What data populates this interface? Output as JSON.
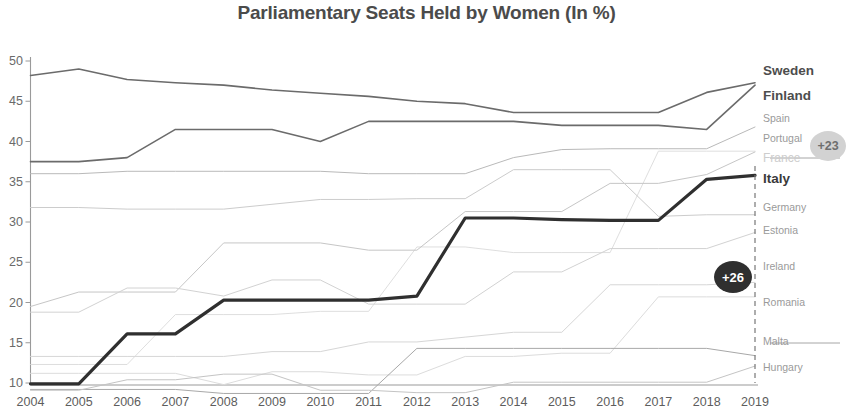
{
  "chart_data": {
    "type": "line",
    "title": "Parliamentary Seats Held by Women (In %)",
    "xlabel": "",
    "ylabel": "",
    "x": [
      2004,
      2005,
      2006,
      2007,
      2008,
      2009,
      2010,
      2011,
      2012,
      2013,
      2014,
      2015,
      2016,
      2017,
      2018,
      2019
    ],
    "xtick_labels": [
      "2004",
      "2005",
      "2006",
      "2007",
      "2008",
      "2009",
      "2010",
      "2011",
      "2012",
      "2013",
      "2014",
      "2015",
      "2016",
      "2017",
      "2018",
      "2019"
    ],
    "ytick_labels": [
      "10",
      "15",
      "20",
      "25",
      "30",
      "35",
      "40",
      "45",
      "50"
    ],
    "yticks": [
      10,
      15,
      20,
      25,
      30,
      35,
      40,
      45,
      50
    ],
    "ylim": [
      9,
      51
    ],
    "xlim": [
      2004,
      2019
    ],
    "grid": false,
    "legend_position": "right-inline",
    "series": [
      {
        "name": "Sweden",
        "emphasis": "strong",
        "color": "#6b6b6b",
        "values": [
          48.2,
          49.0,
          47.7,
          47.3,
          47.0,
          46.4,
          46.0,
          45.6,
          45.0,
          44.7,
          43.6,
          43.6,
          43.6,
          43.6,
          46.1,
          47.3
        ]
      },
      {
        "name": "Finland",
        "emphasis": "strong",
        "color": "#6b6b6b",
        "values": [
          37.5,
          37.5,
          38.0,
          41.5,
          41.5,
          41.5,
          40.0,
          42.5,
          42.5,
          42.5,
          42.5,
          42.0,
          42.0,
          42.0,
          41.5,
          47.0
        ]
      },
      {
        "name": "Spain",
        "emphasis": "faint",
        "color": "#b9b9b9",
        "values": [
          36.0,
          36.0,
          36.3,
          36.3,
          36.3,
          36.3,
          36.3,
          36.0,
          36.0,
          36.0,
          38.0,
          39.0,
          39.1,
          39.1,
          39.1,
          41.8
        ]
      },
      {
        "name": "Portugal",
        "emphasis": "faint",
        "color": "#c6c6c6",
        "values": [
          19.5,
          21.3,
          21.3,
          21.3,
          27.4,
          27.4,
          27.4,
          26.5,
          26.5,
          31.3,
          31.3,
          31.3,
          34.8,
          34.8,
          35.9,
          38.7
        ]
      },
      {
        "name": "France",
        "emphasis": "ghost",
        "color": "#d8d8d8",
        "values": [
          12.3,
          12.3,
          12.3,
          18.5,
          18.5,
          18.5,
          18.9,
          18.9,
          26.9,
          26.9,
          26.2,
          26.2,
          26.2,
          38.8,
          38.8,
          38.8
        ]
      },
      {
        "name": "Italy",
        "emphasis": "medium",
        "color": "#2f2f2f",
        "values": [
          9.9,
          9.9,
          16.1,
          16.1,
          20.3,
          20.3,
          20.3,
          20.3,
          20.8,
          30.5,
          30.5,
          30.3,
          30.2,
          30.2,
          35.3,
          35.8
        ]
      },
      {
        "name": "Germany",
        "emphasis": "faint",
        "color": "#cccccc",
        "values": [
          31.8,
          31.8,
          31.6,
          31.6,
          31.6,
          32.2,
          32.8,
          32.8,
          32.9,
          32.9,
          36.5,
          36.5,
          36.5,
          30.7,
          30.9,
          30.9
        ]
      },
      {
        "name": "Estonia",
        "emphasis": "faint",
        "color": "#d2d2d2",
        "values": [
          18.8,
          18.8,
          21.8,
          21.8,
          20.8,
          22.8,
          22.8,
          19.8,
          19.8,
          19.8,
          23.8,
          23.8,
          26.7,
          26.7,
          26.7,
          28.7
        ]
      },
      {
        "name": "Ireland",
        "emphasis": "faint",
        "color": "#d6d6d6",
        "values": [
          13.3,
          13.3,
          13.3,
          13.3,
          13.3,
          13.9,
          13.9,
          15.1,
          15.1,
          15.7,
          16.3,
          16.3,
          22.2,
          22.2,
          22.2,
          22.5
        ]
      },
      {
        "name": "Romania",
        "emphasis": "faint",
        "color": "#dcdcdc",
        "values": [
          11.2,
          11.2,
          11.2,
          11.2,
          9.8,
          11.4,
          11.4,
          11.0,
          11.0,
          13.3,
          13.3,
          13.7,
          13.7,
          20.7,
          20.7,
          20.7
        ]
      },
      {
        "name": "Malta",
        "emphasis": "faint",
        "color": "#a8a8a8",
        "values": [
          9.2,
          9.2,
          9.2,
          9.2,
          8.7,
          8.7,
          8.7,
          8.7,
          14.3,
          14.3,
          14.3,
          14.3,
          14.3,
          14.3,
          14.3,
          13.4
        ]
      },
      {
        "name": "Hungary",
        "emphasis": "faint",
        "color": "#c4c4c4",
        "values": [
          9.1,
          9.1,
          10.4,
          10.4,
          11.1,
          11.1,
          9.1,
          9.1,
          8.8,
          8.8,
          10.1,
          10.1,
          10.1,
          10.1,
          10.1,
          12.1
        ]
      }
    ],
    "annotations": [
      {
        "id": "italy-delta",
        "label": "+26",
        "style": "dark",
        "attached_to": "Italy"
      },
      {
        "id": "france-delta",
        "label": "+23",
        "style": "light",
        "attached_to": "France"
      }
    ]
  },
  "colors": {
    "title": "#4b4b4b",
    "axis": "#8a8a8a",
    "italy": "#2f2f2f",
    "badge_dark": "#2f2f2f",
    "badge_light": "#d2d2d2"
  }
}
